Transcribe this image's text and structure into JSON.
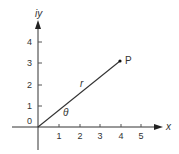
{
  "diagram": {
    "type": "polar-coordinates-illustration",
    "axes": {
      "x_label": "x",
      "y_label": "iy",
      "origin_label": "0",
      "x_ticks": [
        "1",
        "2",
        "3",
        "4",
        "5"
      ],
      "y_ticks": [
        "1",
        "2",
        "3",
        "4"
      ]
    },
    "point": {
      "label": "P",
      "x": 4,
      "y": 3
    },
    "segment_label": "r",
    "angle_label": "θ",
    "colors": {
      "line": "#333333",
      "background": "#ffffff"
    }
  }
}
